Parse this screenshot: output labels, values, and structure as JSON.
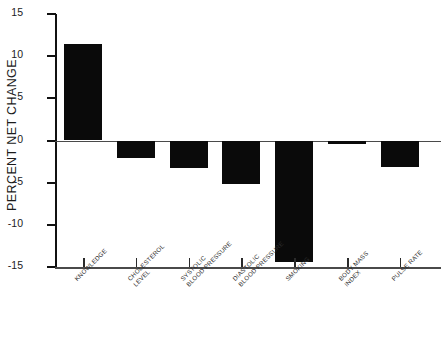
{
  "chart_data": {
    "type": "bar",
    "title": "",
    "xlabel": "",
    "ylabel": "PERCENT NET CHANGE",
    "ylim": [
      -15,
      15
    ],
    "yticks": [
      15,
      10,
      5,
      0,
      -5,
      -10,
      -15
    ],
    "ytick_labels": [
      "15",
      "10",
      "5",
      "0",
      "-5",
      "-10",
      "-15"
    ],
    "grid": false,
    "legend": null,
    "bar_color": "#0a0a0a",
    "categories": [
      "KNOWLEDGE",
      "CHOLESTEROL LEVEL",
      "SYSTOLIC BLOOD PRESSURE",
      "DIASTOLIC BLOOD PRESSURE",
      "SMOKING",
      "BODY MASS INDEX",
      "PULSE RATE"
    ],
    "category_lines": [
      [
        "KNOWLEDGE"
      ],
      [
        "CHOLESTEROL",
        "LEVEL"
      ],
      [
        "SYSTOLIC",
        "BLOOD PRESSURE"
      ],
      [
        "DIASTOLIC",
        "BLOOD PRESSURE"
      ],
      [
        "SMOKING"
      ],
      [
        "BODY MASS",
        "INDEX"
      ],
      [
        "PULSE RATE"
      ]
    ],
    "values": [
      11.5,
      -2.1,
      -3.3,
      -5.1,
      -14.4,
      -0.4,
      -3.2
    ]
  }
}
